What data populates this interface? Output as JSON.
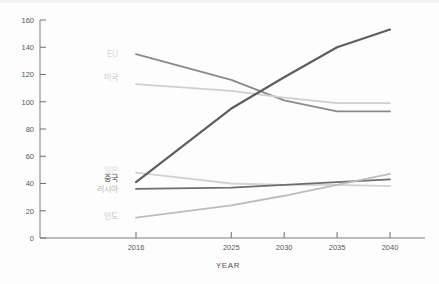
{
  "chart_data": {
    "type": "line",
    "title": "",
    "xlabel": "YEAR",
    "ylabel": "",
    "x": [
      2016,
      2025,
      2030,
      2035,
      2040
    ],
    "xticklabels": [
      "2016",
      "2025",
      "2030",
      "2035",
      "2040"
    ],
    "yticks": [
      0,
      20,
      40,
      60,
      80,
      100,
      120,
      140,
      160
    ],
    "yticklabels": [
      "0",
      "20",
      "40",
      "60",
      "80",
      "100",
      "120",
      "140",
      "160"
    ],
    "ylim": [
      0,
      160
    ],
    "grid": false,
    "legend_position": "inline-left",
    "series": [
      {
        "name": "EU",
        "label": "EU",
        "color": "#8a8a8a",
        "width": 1.8,
        "values": [
          135,
          116,
          101,
          93,
          93
        ]
      },
      {
        "name": "US",
        "label": "미국",
        "color": "#cfcfcf",
        "width": 1.8,
        "values": [
          113,
          108,
          103,
          99,
          99
        ]
      },
      {
        "name": "Japan",
        "label": "일본",
        "color": "#d2d2d2",
        "width": 1.8,
        "values": [
          48,
          40,
          39,
          39,
          38
        ]
      },
      {
        "name": "China",
        "label": "중국",
        "color": "#5e5e5e",
        "width": 2.2,
        "values": [
          41,
          95,
          118,
          140,
          153
        ]
      },
      {
        "name": "Russia",
        "label": "러시아",
        "color": "#6e6e6e",
        "width": 1.8,
        "values": [
          36,
          37,
          39,
          41,
          43
        ]
      },
      {
        "name": "India",
        "label": "인도",
        "color": "#bdbdbd",
        "width": 1.8,
        "values": [
          15,
          24,
          31,
          39,
          47
        ]
      }
    ],
    "inline_labels": [
      {
        "text": "EU",
        "value": 135,
        "color": "#d9d9d9"
      },
      {
        "text": "미국",
        "value": 118,
        "color": "#c9c9c9"
      },
      {
        "text": "일본",
        "value": 50,
        "color": "#dcdcdc"
      },
      {
        "text": "중국",
        "value": 44,
        "color": "#4d4d4d"
      },
      {
        "text": "러시아",
        "value": 36,
        "color": "#b7b7b7"
      },
      {
        "text": "인도",
        "value": 16,
        "color": "#c6c6c6"
      }
    ]
  }
}
